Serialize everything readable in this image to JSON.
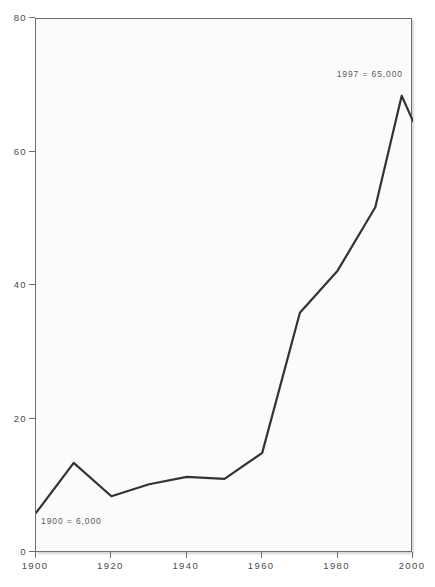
{
  "chart_data": {
    "type": "line",
    "title": "",
    "xlabel": "",
    "ylabel": "",
    "xlim": [
      1900,
      2000
    ],
    "ylim": [
      0,
      80
    ],
    "grid": false,
    "legend": false,
    "x_ticks": [
      "1900",
      "1920",
      "1940",
      "1960",
      "1980",
      "2000"
    ],
    "x_tick_values": [
      1900,
      1920,
      1940,
      1960,
      1980,
      2000
    ],
    "y_ticks": [
      "0",
      "20",
      "40",
      "60",
      "80"
    ],
    "y_tick_values": [
      0,
      20,
      40,
      60,
      80
    ],
    "series": [
      {
        "name": "series-1",
        "color": "#333333",
        "x": [
          1900,
          1910,
          1920,
          1930,
          1940,
          1950,
          1960,
          1970,
          1980,
          1990,
          1997,
          2000
        ],
        "values": [
          6,
          13.5,
          8.5,
          10.3,
          11.4,
          11.1,
          15,
          36,
          42.3,
          51.8,
          68.5,
          64.7
        ]
      }
    ],
    "annotations": [
      {
        "id": "start",
        "text": "1900  =  6,000",
        "x": 1900,
        "y": 4.5
      },
      {
        "id": "end",
        "text": "1997  =  65,000",
        "x": 1993,
        "y": 72
      }
    ]
  },
  "colors": {
    "line": "#333333",
    "plot_background": "#fbfbfb",
    "plot_border": "#6e6e6e",
    "axis_text": "#4a4a4a",
    "annotation_text": "#5a5a5a",
    "page_background": "#ffffff"
  }
}
